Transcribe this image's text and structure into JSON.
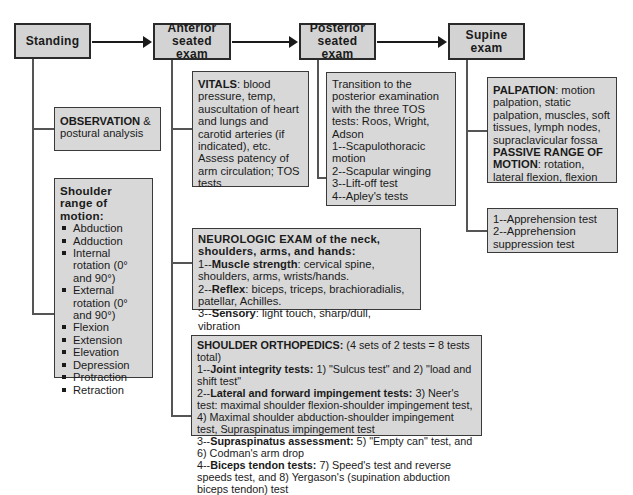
{
  "stages": [
    {
      "id": "standing",
      "label": "Standing"
    },
    {
      "id": "anterior",
      "label": "Anterior seated exam"
    },
    {
      "id": "posterior",
      "label": "Posterior seated exam"
    },
    {
      "id": "supine",
      "label": "Supine exam"
    }
  ],
  "standing": {
    "observation": {
      "bold": "OBSERVATION",
      "rest": " & postural analysis"
    },
    "rom": {
      "title": "Shoulder range of motion:",
      "items": [
        "Abduction",
        "Adduction",
        "Internal rotation (0° and 90°)",
        "External rotation (0° and 90°)",
        "Flexion",
        "Extension",
        "Elevation",
        "Depression",
        "Protraction",
        "Retraction"
      ]
    }
  },
  "anterior": {
    "vitals": {
      "bold": "VITALS",
      "rest": ": blood pressure, temp, auscultation of heart and lungs and carotid arteries (if indicated), etc.  Assess patency of arm circulation; TOS tests"
    },
    "neuro": {
      "title": "NEUROLOGIC EXAM of the neck, shoulders, arms, and hands:",
      "lines": [
        {
          "prefix": "1--",
          "bold": "Muscle strength",
          "rest": ": cervical spine, shoulders, arms, wrists/hands."
        },
        {
          "prefix": "2--",
          "bold": "Reflex",
          "rest": ": biceps, triceps, brachioradialis, patellar, Achilles."
        },
        {
          "prefix": "3--",
          "bold": "Sensory",
          "rest": ": light touch, sharp/dull, vibration"
        }
      ]
    },
    "ortho": {
      "title_bold": "SHOULDER ORTHOPEDICS:",
      "title_rest": " (4 sets of 2 tests = 8 tests total)",
      "lines": [
        {
          "prefix": "1--",
          "bold": "Joint integrity tests:",
          "rest": " 1) \"Sulcus test\" and 2) \"load and shift test\""
        },
        {
          "prefix": "2--",
          "bold": "Lateral and forward impingement tests:",
          "rest": " 3) Neer's test: maximal shoulder flexion-shoulder impingement test, 4) Maximal shoulder abduction-shoulder impingement test, Supraspinatus impingement test"
        },
        {
          "prefix": "3--",
          "bold": "Supraspinatus assessment:",
          "rest": " 5) \"Empty can\" test, and 6) Codman's arm drop"
        },
        {
          "prefix": "4--",
          "bold": "Biceps tendon tests:",
          "rest": " 7) Speed's test and reverse speeds test, and 8) Yergason's (supination abduction biceps tendon) test"
        }
      ]
    }
  },
  "posterior": {
    "intro": "Transition to the posterior examination with the three TOS tests: Roos, Wright, Adson",
    "items": [
      "1--Scapulothoracic motion",
      "2--Scapular winging",
      "3--Lift-off test",
      "4--Apley's tests"
    ]
  },
  "supine": {
    "palpation": {
      "bold": "PALPATION",
      "rest": ": motion palpation, static palpation, muscles, soft tissues, lymph nodes, supraclavicular fossa"
    },
    "prom": {
      "bold": "PASSIVE RANGE OF MOTION",
      "rest": ": rotation, lateral flexion, flexion"
    },
    "apprehension": [
      "1--Apprehension test",
      "2--Apprehension suppression test"
    ]
  },
  "colors": {
    "box_fill": "#d8d8d8",
    "border": "#3a3a3a",
    "connector": "#555555",
    "arrow": "#1a1a1a"
  }
}
